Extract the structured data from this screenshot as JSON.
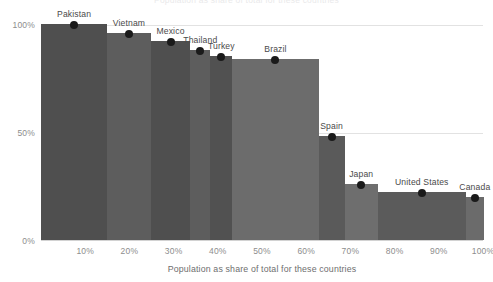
{
  "chart_data": {
    "type": "bar",
    "xlabel": "Population as share of total for these countries",
    "ylabel": "",
    "categories": [
      "Pakistan",
      "Vietnam",
      "Mexico",
      "Thailand",
      "Turkey",
      "Brazil",
      "Spain",
      "Japan",
      "United States",
      "Canada"
    ],
    "values": [
      100,
      96,
      92,
      88,
      85,
      84,
      48,
      26,
      22,
      20
    ],
    "widths": [
      15.0,
      9.8,
      9.0,
      4.5,
      5.0,
      19.5,
      5.9,
      7.5,
      19.9,
      4.1
    ],
    "cumulative_x": [
      0,
      15.0,
      24.8,
      33.8,
      38.3,
      43.3,
      62.8,
      68.7,
      76.2,
      96.1,
      100.2
    ],
    "midpoints_x": [
      7.5,
      19.9,
      29.3,
      36.1,
      40.8,
      53.1,
      65.8,
      72.5,
      86.2,
      98.2
    ],
    "ylim": [
      0,
      100
    ],
    "xlim": [
      0,
      100
    ],
    "ytick_labels": [
      "0%",
      "50%",
      "100%"
    ],
    "ytick_values": [
      0,
      50,
      100
    ],
    "xtick_labels": [
      "10%",
      "20%",
      "30%",
      "40%",
      "50%",
      "60%",
      "70%",
      "80%",
      "90%",
      "100%"
    ],
    "xtick_values": [
      10,
      20,
      30,
      40,
      50,
      60,
      70,
      80,
      90,
      100
    ],
    "grid": "horizontal",
    "legend": "none",
    "marker": "black-dot",
    "bar_colors": [
      "#4f4f4f",
      "#5d5d5d",
      "#4f4f4f",
      "#5d5d5d",
      "#515151",
      "#6c6c6c",
      "#5a5a5a",
      "#6e6e6e",
      "#5b5b5b",
      "#6b6b6b"
    ],
    "series_name": "Share of population",
    "point_labels": [
      "Pakistan",
      "Vietnam",
      "Mexico",
      "Thailand",
      "Turkey",
      "Brazil",
      "Spain",
      "Japan",
      "United States",
      "Canada"
    ]
  },
  "axes": {
    "y_100": "100%",
    "y_50": "50%",
    "y_0": "0%",
    "x_title": "Population as share of total for these countries"
  },
  "title_strip": "Population as share of total for these countries",
  "colors": {
    "background": "#ffffff",
    "gridline": "#e2e2e2",
    "axis_text": "#8d8d8d",
    "label_text": "#4a4a4a",
    "marker": "#1a1a1a"
  }
}
